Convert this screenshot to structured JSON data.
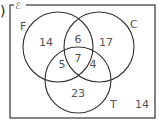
{
  "partial_marker": ")",
  "universal_symbol": "ℰ",
  "sets": {
    "F": {
      "label": "F"
    },
    "C": {
      "label": "C"
    },
    "T": {
      "label": "T"
    }
  },
  "regions": {
    "F_only": "14",
    "F_and_C_only": "6",
    "C_only": "17",
    "F_and_T_only": "5",
    "all_three": "7",
    "C_and_T_only": "4",
    "T_only": "23",
    "outside": "14"
  },
  "colors": {
    "line": "#333333",
    "text": "#555555",
    "background": "#ffffff"
  }
}
